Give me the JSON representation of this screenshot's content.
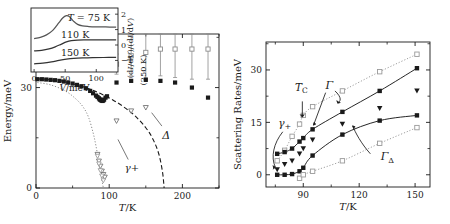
{
  "figure": {
    "title": "",
    "panels": [
      "main-phase-diagram",
      "scattering-rates"
    ]
  },
  "chart_data": [
    {
      "id": "main-panel",
      "type": "scatter",
      "title": "",
      "xlabel": "T/K",
      "ylabel": "Energy/meV",
      "xlim": [
        0,
        250
      ],
      "ylim": [
        0,
        46
      ],
      "xticks": [
        0,
        100,
        200
      ],
      "xtick_labels": [
        "0",
        "100",
        "200"
      ],
      "yticks": [
        0,
        30
      ],
      "ytick_labels": [
        "0",
        "30"
      ],
      "grid": false,
      "annotations": [
        {
          "text": "Δ",
          "x": 178,
          "y": 15.5
        },
        {
          "text": "γ+",
          "x": 131,
          "y": 6.0
        }
      ],
      "series": [
        {
          "name": "peak-position-open-squares-with-errorbars",
          "marker": "open-square",
          "color": "#8c8c8c",
          "x": [
            110,
            130,
            150,
            170,
            190,
            213,
            235
          ],
          "y": [
            37.0,
            39.5,
            40.5,
            41.5,
            41.5,
            41.5,
            41.5
          ],
          "yerr": [
            3.0,
            6.0,
            7.5,
            8.0,
            8.5,
            9.0,
            9.0
          ]
        },
        {
          "name": "gap-filled-squares",
          "marker": "filled-square",
          "color": "#1a1a1a",
          "x": [
            2,
            8,
            14,
            20,
            26,
            32,
            38,
            44,
            50,
            56,
            62,
            68,
            74,
            78,
            82,
            84,
            86,
            87,
            88,
            89,
            90,
            91,
            92,
            93,
            95,
            97,
            110,
            130,
            150,
            170,
            190,
            213,
            235
          ],
          "y": [
            32.5,
            32.5,
            32.4,
            32.3,
            32.2,
            32.0,
            31.8,
            31.5,
            31.2,
            30.8,
            30.4,
            29.8,
            29.0,
            28.3,
            27.6,
            27.2,
            26.8,
            26.5,
            26.3,
            26.2,
            26.1,
            26.0,
            26.2,
            26.4,
            27.0,
            27.4,
            31.5,
            32.0,
            32.3,
            32.0,
            31.5,
            30.0,
            27.0
          ]
        },
        {
          "name": "gamma-plus-open-triangles",
          "marker": "open-triangle-down",
          "color": "#6e6e6e",
          "x": [
            84,
            86,
            88,
            90,
            92,
            94,
            110,
            130,
            150
          ],
          "y": [
            10.0,
            8.0,
            6.5,
            5.0,
            4.0,
            3.2,
            20.0,
            23.0,
            24.0
          ]
        },
        {
          "name": "delta-dashed-fit",
          "marker": "none",
          "linestyle": "dashed",
          "color": "#1a1a1a",
          "x": [
            2,
            20,
            40,
            60,
            75,
            90,
            105,
            120,
            135,
            150,
            160,
            168,
            173,
            175
          ],
          "y": [
            32.6,
            32.3,
            31.7,
            30.5,
            29.4,
            28.0,
            26.3,
            24.2,
            21.6,
            18.0,
            14.5,
            10.0,
            4.5,
            0.0
          ]
        },
        {
          "name": "gamma-plus-dotted-fit",
          "marker": "none",
          "linestyle": "dotted",
          "color": "#8c8c8c",
          "x": [
            2,
            20,
            40,
            55,
            65,
            72,
            78,
            82,
            86,
            89,
            91,
            92
          ],
          "y": [
            31.5,
            30.8,
            29.0,
            26.5,
            24.0,
            21.0,
            16.5,
            12.5,
            7.5,
            3.5,
            1.2,
            0.0
          ]
        }
      ]
    },
    {
      "id": "inset-panel",
      "type": "line",
      "title": "",
      "xlabel": "V/meV",
      "ylabel": "(dI/dV)/(dI/dV)(250 K)",
      "xlim": [
        -5,
        135
      ],
      "ylim": [
        -1.75,
        2.4
      ],
      "xticks": [
        0,
        50,
        100
      ],
      "xtick_labels": [
        "0",
        "50",
        "100"
      ],
      "yticks": [
        2,
        1,
        0,
        -1
      ],
      "ytick_labels": [
        "2",
        "1",
        "0",
        "−1"
      ],
      "grid": false,
      "curve_labels": [
        "T = 75 K",
        "110 K",
        "150 K"
      ],
      "series": [
        {
          "name": "curve-75K",
          "label": "T = 75 K",
          "color": "#555",
          "x": [
            0,
            10,
            20,
            30,
            40,
            46,
            52,
            56,
            60,
            64,
            70,
            78,
            88,
            100,
            115,
            132
          ],
          "y": [
            0.42,
            0.5,
            0.66,
            0.95,
            1.45,
            1.75,
            1.9,
            1.86,
            1.7,
            1.52,
            1.34,
            1.24,
            1.2,
            1.18,
            1.17,
            1.16
          ]
        },
        {
          "name": "curve-110K",
          "label": "110 K",
          "color": "#333",
          "x": [
            0,
            12,
            24,
            34,
            44,
            52,
            60,
            70,
            82,
            96,
            112,
            132
          ],
          "y": [
            -0.38,
            -0.34,
            -0.25,
            -0.12,
            0.06,
            0.2,
            0.28,
            0.32,
            0.33,
            0.33,
            0.33,
            0.33
          ]
        },
        {
          "name": "curve-150K",
          "label": "150 K",
          "color": "#333",
          "x": [
            0,
            14,
            28,
            40,
            52,
            64,
            78,
            94,
            112,
            132
          ],
          "y": [
            -1.22,
            -1.18,
            -1.1,
            -1.0,
            -0.92,
            -0.87,
            -0.84,
            -0.82,
            -0.81,
            -0.8
          ]
        }
      ]
    },
    {
      "id": "right-panel",
      "type": "scatter",
      "title": "",
      "xlabel": "T/K",
      "ylabel": "Scattering Rates/meV",
      "xlim": [
        70,
        158
      ],
      "ylim": [
        -3.5,
        38
      ],
      "xticks": [
        90,
        120,
        150
      ],
      "xtick_labels": [
        "90",
        "120",
        "150"
      ],
      "yticks": [
        0,
        15,
        30
      ],
      "ytick_labels": [
        "0",
        "15",
        "30"
      ],
      "grid": false,
      "annotations": [
        {
          "text": "T_C",
          "x": 89,
          "y": 24.0
        },
        {
          "text": "Γ",
          "x": 104,
          "y": 25.5
        },
        {
          "text": "Γ_Δ",
          "x": 133,
          "y": 5.0
        },
        {
          "text": "γ+",
          "x": 80,
          "y": 14.5
        }
      ],
      "series": [
        {
          "name": "Gamma-open-squares-gray",
          "marker": "open-square",
          "color": "#9a9a9a",
          "linestyle": "dotted",
          "x": [
            76,
            80,
            84,
            88,
            90,
            95,
            111,
            131,
            151
          ],
          "y": [
            4.0,
            7.0,
            11.0,
            14.5,
            17.0,
            19.5,
            24.0,
            29.5,
            34.5
          ]
        },
        {
          "name": "Gamma-filled-squares-black",
          "marker": "filled-square",
          "color": "#1a1a1a",
          "linestyle": "solid",
          "x": [
            76,
            80,
            84,
            88,
            90,
            95,
            111,
            131,
            151
          ],
          "y": [
            6.0,
            6.5,
            7.5,
            9.5,
            10.5,
            13.0,
            18.0,
            24.0,
            30.5
          ]
        },
        {
          "name": "gamma-plus-filled-triangles",
          "marker": "filled-triangle-down",
          "color": "#1a1a1a",
          "x": [
            76,
            80,
            84,
            88,
            90,
            95,
            111,
            131,
            151
          ],
          "y": [
            1.5,
            3.0,
            4.0,
            6.0,
            7.5,
            10.0,
            14.5,
            19.0,
            24.0
          ]
        },
        {
          "name": "Gamma-Delta-filled-squares-black",
          "marker": "filled-square",
          "color": "#1a1a1a",
          "linestyle": "solid",
          "x": [
            76,
            80,
            84,
            88,
            90,
            95,
            111,
            131,
            151
          ],
          "y": [
            0.0,
            0.0,
            0.2,
            1.0,
            2.0,
            5.5,
            11.5,
            15.5,
            17.0
          ]
        },
        {
          "name": "Gamma-Delta-open-squares-gray",
          "marker": "open-square",
          "color": "#9a9a9a",
          "linestyle": "dotted",
          "x": [
            88,
            90,
            95,
            111,
            131,
            151
          ],
          "y": [
            -1.0,
            0.0,
            1.0,
            4.0,
            9.0,
            13.5
          ]
        }
      ]
    }
  ]
}
